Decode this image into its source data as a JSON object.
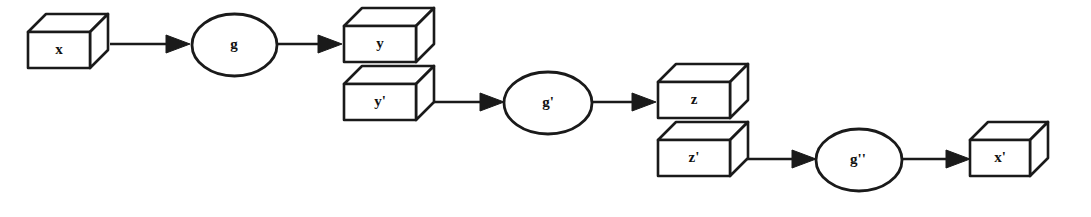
{
  "figure": {
    "title": "",
    "type": "flow-diagram",
    "background_color": "#ffffff",
    "stroke_color": "#1a1a1a",
    "fill_color": "#ffffff"
  },
  "nodes": {
    "box_x": {
      "label": "x",
      "prime": "",
      "shape": "cube",
      "x": 28,
      "y": 14
    },
    "ell_g": {
      "label": "g",
      "prime": "",
      "shape": "ellipse",
      "x": 192,
      "y": 14
    },
    "box_y": {
      "label": "y",
      "prime": "",
      "shape": "cube",
      "x": 344,
      "y": 8
    },
    "box_yp": {
      "label": "y",
      "prime": "'",
      "shape": "cube",
      "x": 344,
      "y": 72
    },
    "ell_gp": {
      "label": "g",
      "prime": "'",
      "shape": "ellipse",
      "x": 508,
      "y": 70
    },
    "box_z": {
      "label": "z",
      "prime": "",
      "shape": "cube",
      "x": 658,
      "y": 64
    },
    "box_zp": {
      "label": "z",
      "prime": "'",
      "shape": "cube",
      "x": 658,
      "y": 128
    },
    "ell_gpp": {
      "label": "g",
      "prime": "''",
      "shape": "ellipse",
      "x": 820,
      "y": 126
    },
    "box_xp": {
      "label": "x",
      "prime": "'",
      "shape": "cube",
      "x": 972,
      "y": 122
    }
  },
  "edges": [
    {
      "name": "edge-x-to-g",
      "from": "box_x",
      "to": "ell_g",
      "label": ""
    },
    {
      "name": "edge-g-to-y",
      "from": "ell_g",
      "to": "box_y",
      "label": ""
    },
    {
      "name": "edge-yp-to-gp",
      "from": "box_yp",
      "to": "ell_gp",
      "label": ""
    },
    {
      "name": "edge-gp-to-z",
      "from": "ell_gp",
      "to": "box_z",
      "label": ""
    },
    {
      "name": "edge-zp-to-gpp",
      "from": "box_zp",
      "to": "ell_gpp",
      "label": ""
    },
    {
      "name": "edge-gpp-to-xp",
      "from": "ell_gpp",
      "to": "box_xp",
      "label": ""
    }
  ],
  "labels": {
    "x": "x",
    "g": "g",
    "y": "y",
    "y_prime": "y'",
    "g_prime": "g'",
    "z": "z",
    "z_prime": "z'",
    "g_double_prime": "g''",
    "x_prime": "x'"
  }
}
